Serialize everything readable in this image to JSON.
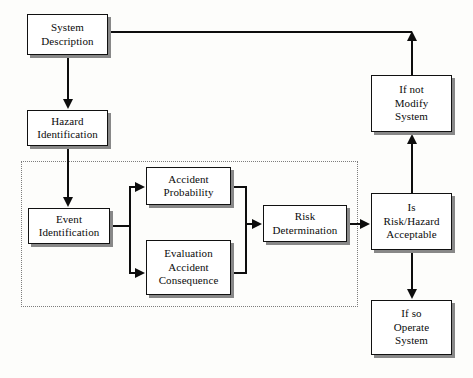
{
  "diagram": {
    "type": "flowchart",
    "canvas": {
      "width": 473,
      "height": 378
    },
    "colors": {
      "background": "#fdfdfb",
      "box_fill": "#ffffff",
      "box_border": "#111111",
      "box_shadow": "#888888",
      "connector": "#0d0d0d",
      "group_border": "#7d7d7d"
    },
    "group_region": {
      "label": "risk-analysis-group",
      "style": "dotted",
      "x": 21,
      "y": 161,
      "width": 337,
      "height": 146
    },
    "nodes": [
      {
        "id": "system-description",
        "label": "System\nDescription",
        "x": 27,
        "y": 14,
        "width": 81,
        "height": 41
      },
      {
        "id": "hazard-identification",
        "label": "Hazard\nIdentification",
        "x": 27,
        "y": 110,
        "width": 81,
        "height": 36
      },
      {
        "id": "event-identification",
        "label": "Event\nIdentification",
        "x": 28,
        "y": 208,
        "width": 82,
        "height": 36
      },
      {
        "id": "accident-probability",
        "label": "Accident\nProbability",
        "x": 146,
        "y": 167,
        "width": 85,
        "height": 38
      },
      {
        "id": "evaluation-accident-consequence",
        "label": "Evaluation\nAccident\nConsequence",
        "x": 146,
        "y": 240,
        "width": 85,
        "height": 55
      },
      {
        "id": "risk-determination",
        "label": "Risk\nDetermination",
        "x": 263,
        "y": 205,
        "width": 84,
        "height": 37
      },
      {
        "id": "is-risk-hazard-acceptable",
        "label": "Is\nRisk/Hazard\nAcceptable",
        "x": 371,
        "y": 193,
        "width": 81,
        "height": 57
      },
      {
        "id": "if-not-modify-system",
        "label": "If not\nModify\nSystem",
        "x": 371,
        "y": 75,
        "width": 81,
        "height": 57
      },
      {
        "id": "if-so-operate-system",
        "label": "If so\nOperate\nSystem",
        "x": 371,
        "y": 300,
        "width": 81,
        "height": 55
      }
    ],
    "edges": [
      {
        "id": "e1",
        "from": "system-description",
        "to": "hazard-identification",
        "arrow": "down"
      },
      {
        "id": "e2",
        "from": "hazard-identification",
        "to": "event-identification",
        "arrow": "down"
      },
      {
        "id": "e3",
        "from": "event-identification",
        "to": "accident-probability",
        "arrow": "right"
      },
      {
        "id": "e4",
        "from": "event-identification",
        "to": "evaluation-accident-consequence",
        "arrow": "right"
      },
      {
        "id": "e5",
        "from": "accident-probability",
        "to": "risk-determination",
        "arrow": "right"
      },
      {
        "id": "e6",
        "from": "evaluation-accident-consequence",
        "to": "risk-determination",
        "arrow": "right"
      },
      {
        "id": "e7",
        "from": "risk-determination",
        "to": "is-risk-hazard-acceptable",
        "arrow": "right"
      },
      {
        "id": "e8",
        "from": "is-risk-hazard-acceptable",
        "to": "if-not-modify-system",
        "arrow": "up"
      },
      {
        "id": "e9",
        "from": "is-risk-hazard-acceptable",
        "to": "if-so-operate-system",
        "arrow": "down"
      },
      {
        "id": "e10",
        "from": "if-not-modify-system",
        "to": "system-description",
        "arrow": "up"
      }
    ]
  }
}
